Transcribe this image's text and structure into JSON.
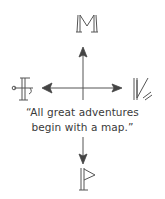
{
  "compass": {
    "north_glyph": "M",
    "south_glyph": "flag",
    "east_glyph": "N-rune",
    "west_glyph": "F-rune",
    "stroke_color": "#4a4a4a",
    "arrow_color": "#3c3c3c"
  },
  "quote": {
    "line1": "“All great adventures",
    "line2": "begin with a map.”"
  }
}
